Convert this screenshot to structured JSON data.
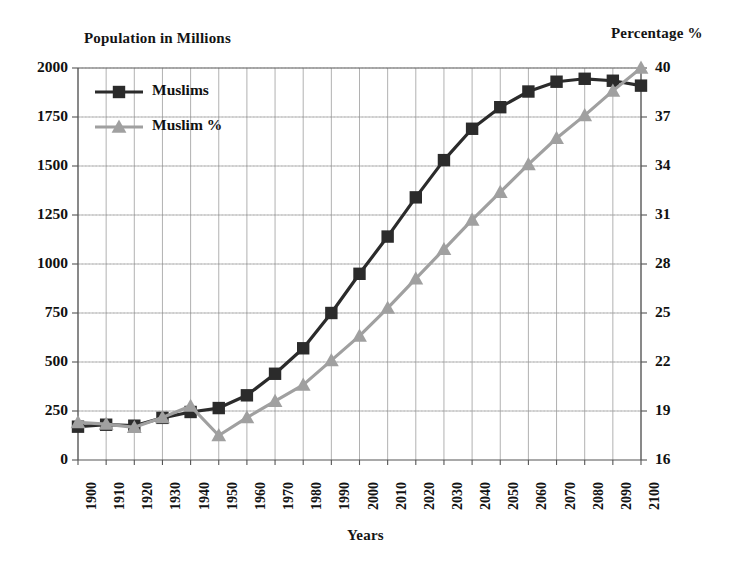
{
  "chart_data": {
    "type": "line",
    "title": "",
    "xlabel": "Years",
    "ylabel": "Population in Millions",
    "y2label": "Percentage %",
    "grid": true,
    "legend_position": "top-left",
    "categories": [
      1900,
      1910,
      1920,
      1930,
      1940,
      1950,
      1960,
      1970,
      1980,
      1990,
      2000,
      2010,
      2020,
      2030,
      2040,
      2050,
      2060,
      2070,
      2080,
      2090,
      2100
    ],
    "xtick_labels": [
      "1900",
      "1910",
      "1920",
      "1930",
      "1940",
      "1950",
      "1960",
      "1970",
      "1980",
      "1990",
      "2000",
      "2010",
      "2020",
      "2030",
      "2040",
      "2050",
      "2060",
      "2070",
      "2080",
      "2090",
      "2100"
    ],
    "ylim": [
      0,
      2000
    ],
    "ytick_labels": [
      "0",
      "250",
      "500",
      "750",
      "1000",
      "1250",
      "1500",
      "1750",
      "2000"
    ],
    "ytick_values": [
      0,
      250,
      500,
      750,
      1000,
      1250,
      1500,
      1750,
      2000
    ],
    "y2lim": [
      16,
      40
    ],
    "y2tick_labels": [
      "16",
      "19",
      "22",
      "25",
      "28",
      "31",
      "34",
      "37",
      "40"
    ],
    "y2tick_values": [
      16,
      19,
      22,
      25,
      28,
      31,
      34,
      37,
      40
    ],
    "series": [
      {
        "name": "Muslims",
        "axis": "left",
        "color": "#2b2b2b",
        "marker": "square",
        "values": [
          170,
          180,
          175,
          215,
          245,
          265,
          330,
          440,
          570,
          750,
          950,
          1140,
          1340,
          1530,
          1690,
          1800,
          1880,
          1930,
          1945,
          1935,
          1910
        ]
      },
      {
        "name": "Muslim %",
        "axis": "right",
        "color": "#a0a0a0",
        "marker": "triangle",
        "values": [
          18.3,
          18.2,
          18.0,
          18.6,
          19.3,
          17.5,
          18.6,
          19.6,
          20.6,
          22.1,
          23.6,
          25.3,
          27.1,
          28.9,
          30.7,
          32.4,
          34.1,
          35.7,
          37.1,
          38.6,
          40.0
        ]
      }
    ]
  },
  "legend": {
    "items": [
      {
        "label": "Muslims"
      },
      {
        "label": "Muslim %"
      }
    ]
  }
}
